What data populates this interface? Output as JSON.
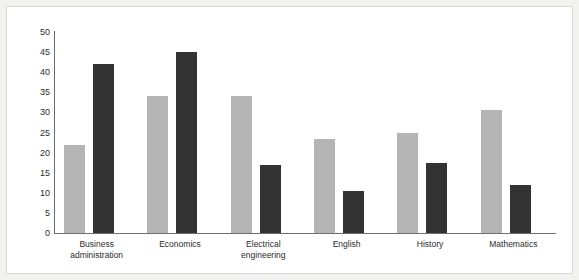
{
  "chart": {
    "title": "",
    "background_color": "#ffffff",
    "page_background_color": "#f2f2f0",
    "axis_color": "#6e6e6e"
  },
  "chart_data": {
    "type": "bar",
    "title": "",
    "xlabel": "",
    "ylabel": "",
    "ylim": [
      0,
      50
    ],
    "grid": false,
    "legend": "none",
    "categories": [
      "Business administration",
      "Economics",
      "Electrical engineering",
      "English",
      "History",
      "Mathematics"
    ],
    "category_lines": [
      [
        "Business",
        "administration"
      ],
      [
        "Economics"
      ],
      [
        "Electrical",
        "engineering"
      ],
      [
        "English"
      ],
      [
        "History"
      ],
      [
        "Mathematics"
      ]
    ],
    "y_ticks": [
      0,
      5,
      10,
      15,
      20,
      25,
      30,
      35,
      40,
      45,
      50
    ],
    "series": [
      {
        "name": "Series 1",
        "color": "#b4b4b4",
        "values": [
          22,
          34,
          34,
          23.5,
          25,
          30.5
        ]
      },
      {
        "name": "Series 2",
        "color": "#333333",
        "values": [
          42,
          45,
          17,
          10.5,
          17.5,
          12
        ]
      }
    ]
  }
}
